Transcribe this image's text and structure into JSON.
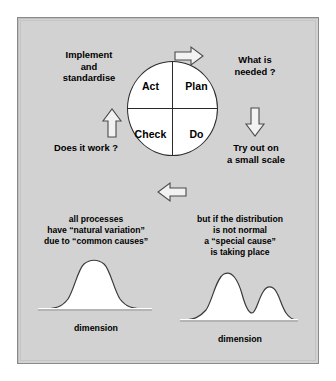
{
  "figure": {
    "background_color": "#ffffff",
    "panel_color": "#d2d2d2",
    "border_color": "#8a8a8a",
    "ink_color": "#000000"
  },
  "cycle": {
    "quadrants": [
      {
        "key": "act",
        "label": "Act"
      },
      {
        "key": "plan",
        "label": "Plan"
      },
      {
        "key": "check",
        "label": "Check"
      },
      {
        "key": "do",
        "label": "Do"
      }
    ],
    "arrows": [
      {
        "key": "top",
        "direction": "right",
        "icon": "arrow-right-icon"
      },
      {
        "key": "right",
        "direction": "down",
        "icon": "arrow-down-icon"
      },
      {
        "key": "bottom",
        "direction": "left",
        "icon": "arrow-left-icon"
      },
      {
        "key": "left",
        "direction": "up",
        "icon": "arrow-up-icon"
      }
    ],
    "labels": {
      "implement": "Implement\nand\nstandardise",
      "needed": "What is\nneeded ?",
      "work": "Does it work ?",
      "tryout": "Try out on\na small scale"
    }
  },
  "distributions": [
    {
      "key": "common-cause",
      "caption": "all processes\nhave “natural variation”\ndue to “common causes”",
      "axis_label": "dimension",
      "shape": "unimodal-normal"
    },
    {
      "key": "special-cause",
      "caption": "but if the distribution\nis not normal\na “special cause”\nis taking place",
      "axis_label": "dimension",
      "shape": "bimodal"
    }
  ]
}
